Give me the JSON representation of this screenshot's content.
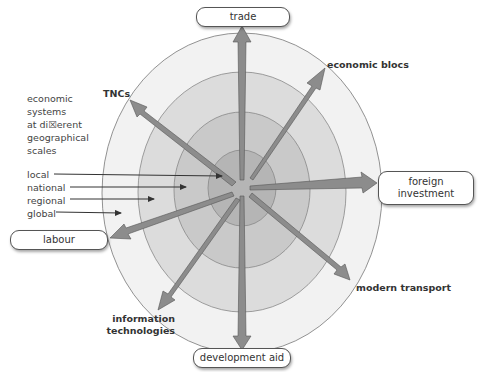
{
  "diagram": {
    "title_legend": [
      "economic",
      "systems",
      "at di☒erent",
      "geographical",
      "scales"
    ],
    "scales": [
      "local",
      "national",
      "regional",
      "global"
    ],
    "boxed_labels": {
      "trade": "trade",
      "foreign_investment": [
        "foreign",
        "investment"
      ],
      "labour": "labour",
      "development_aid": "development aid"
    },
    "bold_labels": {
      "tncs": "TNCs",
      "economic_blocs": "economic blocs",
      "modern_transport": "modern transport",
      "information_technologies": [
        "information",
        "technologies"
      ]
    },
    "colors": {
      "ring_local": "#b8b8b8",
      "ring_national": "#c8c8c8",
      "ring_regional": "#d9d9d9",
      "ring_global": "#eeeeee",
      "arrow": "#8a8a8a",
      "arrow_edge": "#555555"
    }
  }
}
